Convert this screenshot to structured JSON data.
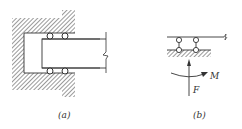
{
  "figure": {
    "panels": [
      {
        "id": "a",
        "caption": "(a)",
        "description": "Beam end held in a hatched socket support by two pairs of rollers (top and bottom)"
      },
      {
        "id": "b",
        "caption": "(b)",
        "description": "Equivalent support: beam on two roller links over hatched ground, with reaction force F and moment M",
        "force_label": "F",
        "moment_label": "M"
      }
    ],
    "colors": {
      "stroke": "#333333",
      "hatch": "#555555",
      "background": "#ffffff"
    }
  }
}
